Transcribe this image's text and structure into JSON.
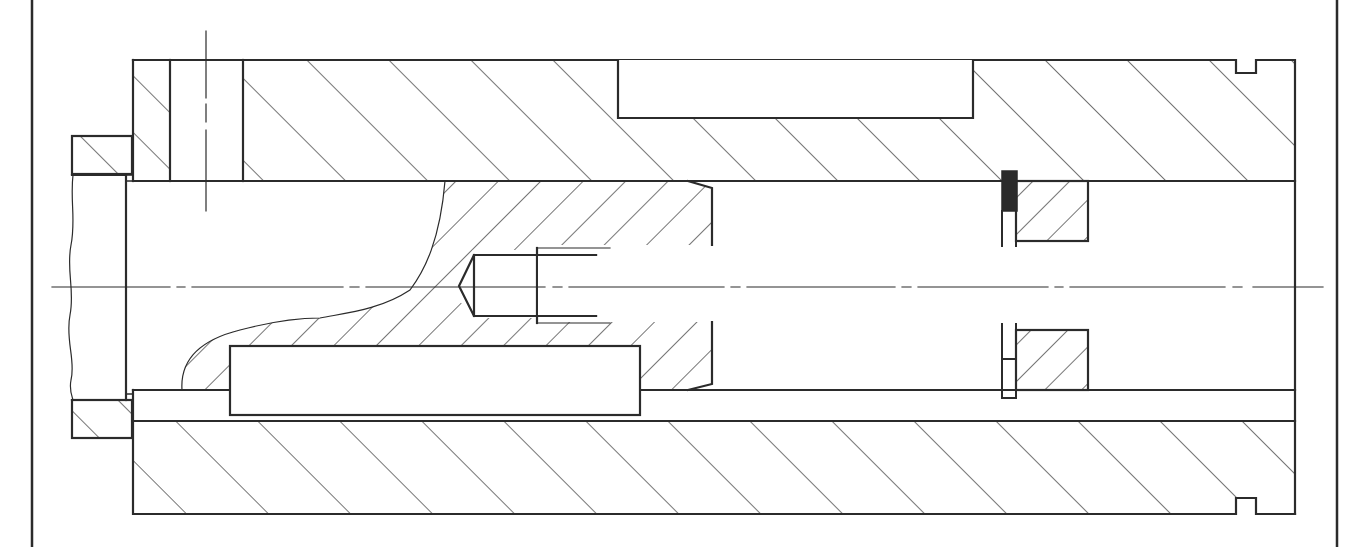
{
  "drawing": {
    "type": "mechanical-cross-section",
    "description": "Sectional view of a cylindrical housing with inner plunger, side key, threaded center hole, retaining ring groove and seal",
    "colors": {
      "line": "#2b2b2b",
      "background": "#ffffff",
      "seal_fill": "#2b2b2b"
    },
    "frame": {
      "left_x": 32,
      "right_x": 1337
    },
    "centerline_y": 285,
    "parts": [
      {
        "id": "outer-housing",
        "label": "Outer housing (sectioned)",
        "hatch": "backslash"
      },
      {
        "id": "left-collar",
        "label": "Left collar ring",
        "hatch": "backslash"
      },
      {
        "id": "flange-stub",
        "label": "Left shaft stub with break line",
        "hatch": "none"
      },
      {
        "id": "plunger",
        "label": "Inner plunger (partial section)",
        "hatch": "slash"
      },
      {
        "id": "key",
        "label": "Guide key",
        "hatch": "none"
      },
      {
        "id": "top-slot",
        "label": "Top keyway slot",
        "hatch": "none"
      },
      {
        "id": "ring-seat",
        "label": "Retaining ring / seat",
        "hatch": "slash"
      },
      {
        "id": "seal",
        "label": "Seal element (filled)",
        "hatch": "solid"
      },
      {
        "id": "radial-bore",
        "label": "Radial bore with centerline",
        "hatch": "none"
      },
      {
        "id": "threaded-hole",
        "label": "Threaded blind hole",
        "hatch": "none"
      }
    ]
  }
}
